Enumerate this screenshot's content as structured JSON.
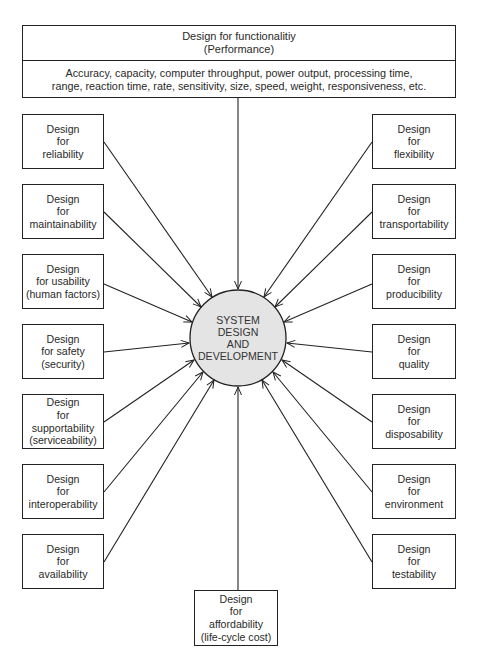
{
  "diagram": {
    "type": "hub-and-spoke",
    "colors": {
      "line": "#222222",
      "hub_fill": "#e4e4e4",
      "text": "#2a2a2a"
    },
    "top": {
      "title": "Design for functionalitiy",
      "subtitle": "(Performance)",
      "description_line1": "Accuracy, capacity, computer throughput, power output, processing time,",
      "description_line2": "range, reaction time, rate, sensitivity, size, speed, weight, responsiveness, etc."
    },
    "hub": {
      "line1": "SYSTEM",
      "line2": "DESIGN",
      "line3": "AND",
      "line4": "DEVELOPMENT"
    },
    "left": [
      {
        "l1": "Design",
        "l2": "for",
        "l3": "reliability",
        "l4": ""
      },
      {
        "l1": "Design",
        "l2": "for",
        "l3": "maintainability",
        "l4": ""
      },
      {
        "l1": "Design",
        "l2": "for usability",
        "l3": "(human factors)",
        "l4": ""
      },
      {
        "l1": "Design",
        "l2": "for safety",
        "l3": "(security)",
        "l4": ""
      },
      {
        "l1": "Design",
        "l2": "for",
        "l3": "supportability",
        "l4": "(serviceability)"
      },
      {
        "l1": "Design",
        "l2": "for",
        "l3": "interoperability",
        "l4": ""
      },
      {
        "l1": "Design",
        "l2": "for",
        "l3": "availability",
        "l4": ""
      }
    ],
    "right": [
      {
        "l1": "Design",
        "l2": "for",
        "l3": "flexibility"
      },
      {
        "l1": "Design",
        "l2": "for",
        "l3": "transportability"
      },
      {
        "l1": "Design",
        "l2": "for",
        "l3": "producibility"
      },
      {
        "l1": "Design",
        "l2": "for",
        "l3": "quality"
      },
      {
        "l1": "Design",
        "l2": "for",
        "l3": "disposability"
      },
      {
        "l1": "Design",
        "l2": "for",
        "l3": "environment"
      },
      {
        "l1": "Design",
        "l2": "for",
        "l3": "testability"
      }
    ],
    "bottom": {
      "l1": "Design",
      "l2": "for",
      "l3": "affordability",
      "l4": "(life-cycle cost)"
    }
  }
}
